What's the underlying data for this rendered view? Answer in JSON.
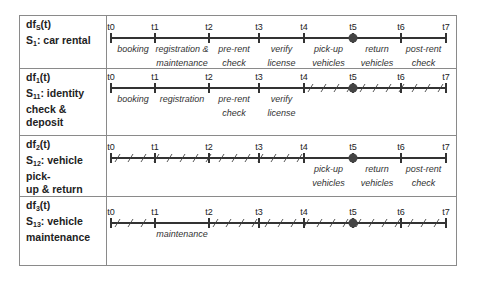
{
  "rows": [
    {
      "function": "df",
      "function_sub": "S",
      "function_arg": "(t)",
      "service": "S",
      "service_sub": "1",
      "service_name": ": car rental",
      "name_line2": "",
      "hatched_segments": [],
      "activities": [
        {
          "from": "t0",
          "to": "t1",
          "lines": [
            "booking"
          ]
        },
        {
          "from": "t1",
          "to": "t2",
          "lines": [
            "registration &",
            "maintenance"
          ]
        },
        {
          "from": "t2",
          "to": "t3",
          "lines": [
            "pre-rent",
            "check"
          ]
        },
        {
          "from": "t3",
          "to": "t4",
          "lines": [
            "verify",
            "license"
          ]
        },
        {
          "from": "t4",
          "to": "t5",
          "lines": [
            "pick-up",
            "vehicles"
          ]
        },
        {
          "from": "t5",
          "to": "t6",
          "lines": [
            "return",
            "vehicles"
          ]
        },
        {
          "from": "t6",
          "to": "t7",
          "lines": [
            "post-rent",
            "check"
          ]
        }
      ]
    },
    {
      "function": "df",
      "function_sub": "1",
      "function_arg": "(t)",
      "service": "S",
      "service_sub": "11",
      "service_name": ": identity",
      "name_line2": "check & deposit",
      "hatched_segments": [
        "t4-t7"
      ],
      "activities": [
        {
          "from": "t0",
          "to": "t1",
          "lines": [
            "booking"
          ]
        },
        {
          "from": "t1",
          "to": "t2",
          "lines": [
            "registration"
          ]
        },
        {
          "from": "t2",
          "to": "t3",
          "lines": [
            "pre-rent",
            "check"
          ]
        },
        {
          "from": "t3",
          "to": "t4",
          "lines": [
            "verify",
            "license"
          ]
        }
      ]
    },
    {
      "function": "df",
      "function_sub": "2",
      "function_arg": "(t)",
      "service": "S",
      "service_sub": "12",
      "service_name": ": vehicle pick-",
      "name_line2": "up & return",
      "hatched_segments": [
        "t0-t4"
      ],
      "activities": [
        {
          "from": "t4",
          "to": "t5",
          "lines": [
            "pick-up",
            "vehicles"
          ]
        },
        {
          "from": "t5",
          "to": "t6",
          "lines": [
            "return",
            "vehicles"
          ]
        },
        {
          "from": "t6",
          "to": "t7",
          "lines": [
            "post-rent",
            "check"
          ]
        }
      ]
    },
    {
      "function": "df",
      "function_sub": "3",
      "function_arg": "(t)",
      "service": "S",
      "service_sub": "13",
      "service_name": ": vehicle",
      "name_line2": "maintenance",
      "hatched_segments": [
        "t0-t1",
        "t2-t7"
      ],
      "activities": [
        {
          "from": "t1",
          "to": "t2",
          "lines": [
            "maintenance"
          ]
        }
      ]
    }
  ],
  "time_points": [
    "t0",
    "t1",
    "t2",
    "t3",
    "t4",
    "t5",
    "t6",
    "t7"
  ],
  "highlight_point": "t5",
  "colors": {
    "line": "#333333",
    "border": "#8a8a8a",
    "dot": "#444444"
  }
}
